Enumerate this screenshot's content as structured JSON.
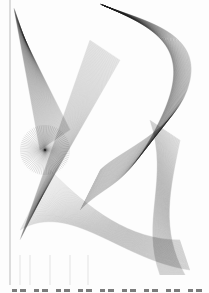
{
  "image": {
    "subject": "string-art / line-sweep ruled surface drawing",
    "palette": {
      "ink": "#222222",
      "paper": "#fdfdfd"
    }
  },
  "caption": {
    "text": ""
  }
}
